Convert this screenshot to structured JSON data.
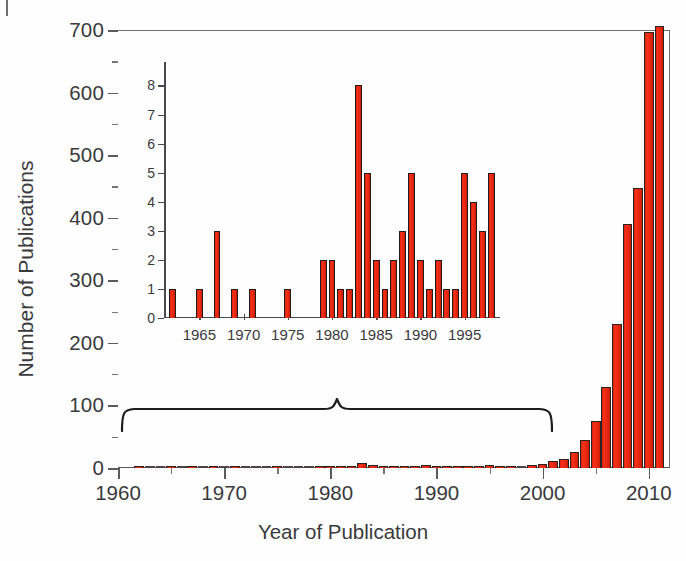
{
  "chart_data": {
    "type": "bar",
    "title": "",
    "xlabel": "Year of Publication",
    "ylabel": "Number of Publications",
    "xlim": [
      1960,
      2012
    ],
    "ylim": [
      0,
      700
    ],
    "x_ticks_major": [
      1960,
      1970,
      1980,
      1990,
      2000,
      2010
    ],
    "x_ticks_minor": [
      1965,
      1975,
      1985,
      1995,
      2005
    ],
    "y_ticks_major": [
      0,
      100,
      200,
      300,
      400,
      500,
      600,
      700
    ],
    "y_ticks_minor": [
      50,
      150,
      250,
      350,
      450,
      550,
      650
    ],
    "grid": false,
    "legend": null,
    "bar_color": "#ee2a12",
    "bar_edge_color": "#231e1b",
    "axis_color": "#5a5a5f",
    "text_color": "#3a3a3c",
    "annotation": {
      "type": "curly-brace",
      "x_start": 1961,
      "x_end": 2000,
      "y": 95,
      "note": "brace indicating the range magnified in the inset"
    },
    "x": [
      1962,
      1963,
      1964,
      1965,
      1966,
      1967,
      1968,
      1969,
      1970,
      1971,
      1972,
      1973,
      1974,
      1975,
      1976,
      1977,
      1978,
      1979,
      1980,
      1981,
      1982,
      1983,
      1984,
      1985,
      1986,
      1987,
      1988,
      1989,
      1990,
      1991,
      1992,
      1993,
      1994,
      1995,
      1996,
      1997,
      1998,
      1999,
      2000,
      2001,
      2002,
      2003,
      2004,
      2005,
      2006,
      2007,
      2008,
      2009,
      2010,
      2011
    ],
    "values": [
      1,
      0,
      0,
      1,
      0,
      3,
      0,
      1,
      0,
      1,
      0,
      0,
      0,
      1,
      0,
      0,
      0,
      2,
      2,
      1,
      1,
      8,
      5,
      2,
      1,
      2,
      3,
      5,
      2,
      1,
      2,
      1,
      1,
      5,
      4,
      3,
      0,
      5,
      6,
      11,
      14,
      25,
      45,
      75,
      130,
      230,
      390,
      448,
      697,
      706
    ]
  },
  "inset_chart_data": {
    "type": "bar",
    "title": "",
    "xlabel": "",
    "ylabel": "",
    "xlim": [
      1961,
      1999
    ],
    "ylim": [
      0,
      8.6
    ],
    "x_ticks_major": [
      1965,
      1970,
      1975,
      1980,
      1985,
      1990,
      1995
    ],
    "y_ticks_major": [
      0,
      1,
      2,
      3,
      4,
      5,
      6,
      7,
      8
    ],
    "grid": false,
    "bar_color": "#ee2a12",
    "bar_edge_color": "#231e1b",
    "x": [
      1962,
      1963,
      1964,
      1965,
      1966,
      1967,
      1968,
      1969,
      1970,
      1971,
      1972,
      1973,
      1974,
      1975,
      1976,
      1977,
      1978,
      1979,
      1980,
      1981,
      1982,
      1983,
      1984,
      1985,
      1986,
      1987,
      1988,
      1989,
      1990,
      1991,
      1992,
      1993,
      1994,
      1995,
      1996,
      1997,
      1998
    ],
    "values": [
      1,
      0,
      0,
      1,
      0,
      3,
      0,
      1,
      0,
      1,
      0,
      0,
      0,
      1,
      0,
      0,
      0,
      2,
      2,
      1,
      1,
      8,
      5,
      2,
      1,
      2,
      3,
      5,
      2,
      1,
      2,
      1,
      1,
      5,
      4,
      3,
      5
    ]
  },
  "axes": {
    "y_title": "Number of Publications",
    "x_title": "Year of Publication",
    "y_tick_labels": [
      "0",
      "100",
      "200",
      "300",
      "400",
      "500",
      "600",
      "700"
    ],
    "x_tick_labels": [
      "1960",
      "1970",
      "1980",
      "1990",
      "2000",
      "2010"
    ]
  },
  "inset_axes": {
    "y_tick_labels": [
      "0",
      "1",
      "2",
      "3",
      "4",
      "5",
      "6",
      "7",
      "8"
    ],
    "x_tick_labels": [
      "1965",
      "1970",
      "1975",
      "1980",
      "1985",
      "1990",
      "1995"
    ]
  }
}
